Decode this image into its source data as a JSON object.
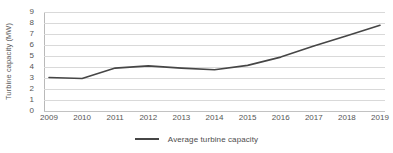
{
  "chart_data": {
    "type": "line",
    "title": "",
    "subtitle": "",
    "xlabel": "",
    "ylabel": "Turbine capacity (MW)",
    "categories": [
      "2009",
      "2010",
      "2011",
      "2012",
      "2013",
      "2014",
      "2015",
      "2016",
      "2017",
      "2018",
      "2019"
    ],
    "x": [
      2009,
      2010,
      2011,
      2012,
      2013,
      2014,
      2015,
      2016,
      2017,
      2018,
      2019
    ],
    "series": [
      {
        "name": "Average turbine capacity",
        "values": [
          3.05,
          2.95,
          3.9,
          4.1,
          3.9,
          3.75,
          4.15,
          4.9,
          5.9,
          6.85,
          7.8
        ],
        "color": "#464646"
      }
    ],
    "ylim": [
      0,
      9
    ],
    "yticks": [
      0,
      1,
      2,
      3,
      4,
      5,
      6,
      7,
      8,
      9
    ],
    "ytick_labels": [
      "0",
      "1",
      "2",
      "3",
      "4",
      "5",
      "6",
      "7",
      "8",
      "9"
    ],
    "grid": true,
    "grid_axis": "y",
    "grid_color": "#d9d9d9",
    "legend": true,
    "legend_position": "bottom",
    "legend_entries": [
      "Average turbine capacity"
    ],
    "background": "#ffffff"
  },
  "legend": {
    "label": "Average turbine capacity"
  },
  "axes": {
    "y_title": "Turbine capacity (MW)"
  }
}
